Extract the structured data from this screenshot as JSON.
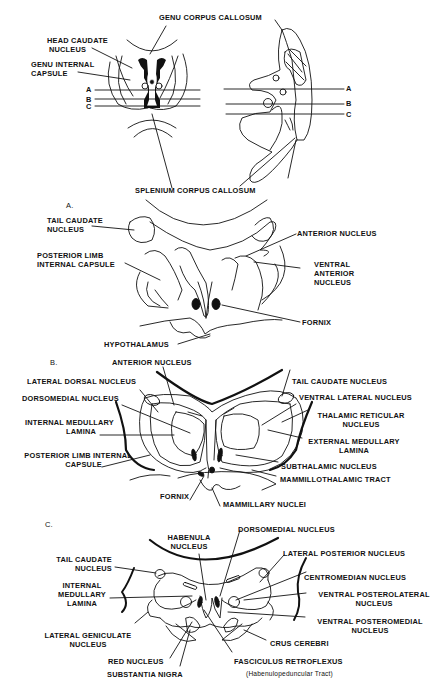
{
  "overview": {
    "labels": {
      "genu_corpus_callosum": "GENU CORPUS CALLOSUM",
      "head_caudate": [
        "HEAD CAUDATE",
        "NUCLEUS"
      ],
      "genu_internal_capsule": [
        "GENU INTERNAL",
        "CAPSULE"
      ],
      "splenium_corpus_callosum": "SPLENIUM CORPUS CALLOSUM",
      "plane_a": "A",
      "plane_b": "B",
      "plane_c": "C"
    }
  },
  "section_a": {
    "marker": "A.",
    "labels": {
      "tail_caudate": [
        "TAIL CAUDATE",
        "NUCLEUS"
      ],
      "posterior_limb": [
        "POSTERIOR LIMB",
        "INTERNAL CAPSULE"
      ],
      "anterior_nucleus": "ANTERIOR NUCLEUS",
      "ventral_anterior": [
        "VENTRAL",
        "ANTERIOR",
        "NUCLEUS"
      ],
      "fornix": "FORNIX",
      "hypothalamus": "HYPOTHALAMUS"
    }
  },
  "section_b": {
    "marker": "B.",
    "labels": {
      "anterior_nucleus": "ANTERIOR NUCLEUS",
      "lateral_dorsal": "LATERAL DORSAL NUCLEUS",
      "dorsomedial": "DORSOMEDIAL NUCLEUS",
      "internal_medullary": [
        "INTERNAL MEDULLARY",
        "LAMINA"
      ],
      "posterior_limb": [
        "POSTERIOR LIMB INTERNAL",
        "CAPSULE"
      ],
      "tail_caudate": "TAIL CAUDATE NUCLEUS",
      "ventral_lateral": "VENTRAL LATERAL NUCLEUS",
      "thalamic_reticular": [
        "THALAMIC RETICULAR",
        "NUCLEUS"
      ],
      "external_medullary": [
        "EXTERNAL MEDULLARY",
        "LAMINA"
      ],
      "subthalamic": "SUBTHALAMIC NUCLEUS",
      "mammillothalamic": "MAMMILLOTHALAMIC TRACT",
      "fornix": "FORNIX",
      "mammillary": "MAMMILLARY NUCLEI"
    }
  },
  "section_c": {
    "marker": "C.",
    "labels": {
      "habenula": [
        "HABENULA",
        "NUCLEUS"
      ],
      "dorsomedial": "DORSOMEDIAL NUCLEUS",
      "lateral_posterior": "LATERAL POSTERIOR NUCLEUS",
      "tail_caudate": [
        "TAIL CAUDATE",
        "NUCLEUS"
      ],
      "internal_medullary": [
        "INTERNAL",
        "MEDULLARY",
        "LAMINA"
      ],
      "centromedian": "CENTROMEDIAN NUCLEUS",
      "vpl": [
        "VENTRAL  POSTEROLATERAL",
        "NUCLEUS"
      ],
      "vpm": [
        "VENTRAL POSTEROMEDIAL",
        "NUCLEUS"
      ],
      "lateral_geniculate": [
        "LATERAL GENICULATE",
        "NUCLEUS"
      ],
      "crus_cerebri": "CRUS CEREBRI",
      "red_nucleus": "RED NUCLEUS",
      "substantia_nigra": "SUBSTANTIA NIGRA",
      "fasciculus_retroflexus": "FASCICULUS RETROFLEXUS",
      "habenulopeduncular": "(Habenulopeduncular Tract)"
    }
  }
}
